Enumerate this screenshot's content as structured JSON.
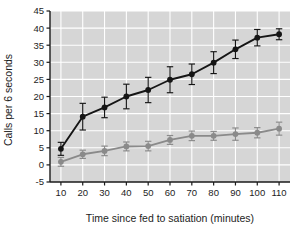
{
  "chart_data": {
    "type": "line",
    "title": "",
    "subtitle": "",
    "xlabel": "Time since fed to satiation (minutes)",
    "ylabel": "Calls per 6 seconds",
    "x": [
      10,
      20,
      30,
      40,
      50,
      60,
      70,
      80,
      90,
      100,
      110
    ],
    "xticklabels": [
      "10",
      "20",
      "30",
      "40",
      "50",
      "60",
      "70",
      "80",
      "90",
      "100",
      "110"
    ],
    "yticks": [
      -5,
      0,
      5,
      10,
      15,
      20,
      25,
      30,
      35,
      40,
      45
    ],
    "yticklabels": [
      "-5",
      "0",
      "5",
      "10",
      "15",
      "20",
      "25",
      "30",
      "35",
      "40",
      "45"
    ],
    "xlim": [
      5,
      115
    ],
    "ylim": [
      -5,
      45
    ],
    "grid": true,
    "grid_color": "#ffffff",
    "plot_background": "#d6d6d6",
    "legend": "none",
    "series": [
      {
        "name": "black-series",
        "color": "#151515",
        "marker": "filled-circle",
        "values": [
          4.7,
          14.1,
          16.8,
          20.0,
          21.9,
          24.9,
          26.5,
          29.9,
          33.8,
          37.2,
          38.2
        ],
        "errors": [
          1.9,
          3.9,
          3.0,
          3.6,
          3.7,
          3.8,
          3.0,
          3.2,
          2.7,
          2.4,
          1.6
        ]
      },
      {
        "name": "gray-series",
        "color": "#8a8a8a",
        "marker": "filled-circle",
        "values": [
          0.9,
          3.1,
          4.1,
          5.4,
          5.5,
          7.3,
          8.5,
          8.5,
          9.0,
          9.4,
          10.6
        ],
        "errors": [
          1.3,
          1.2,
          1.4,
          1.3,
          1.4,
          1.3,
          1.4,
          1.3,
          1.8,
          1.5,
          1.9
        ]
      }
    ]
  }
}
